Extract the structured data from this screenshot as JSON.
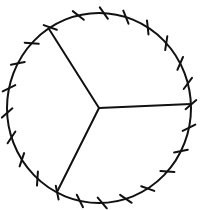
{
  "figure": {
    "type": "circle-divided-into-sectors",
    "width": 207,
    "height": 210,
    "background": "#ffffff",
    "stroke_color": "#111111",
    "circle": {
      "cx": 99,
      "cy": 108,
      "rx": 92,
      "ry": 95,
      "stroke_width": 2
    },
    "center": {
      "x": 99,
      "y": 108
    },
    "radii": [
      {
        "label": "upper-left",
        "x": 49,
        "y": 29
      },
      {
        "label": "right",
        "x": 191,
        "y": 104
      },
      {
        "label": "lower-left",
        "x": 57,
        "y": 192
      }
    ],
    "sector_count": 3,
    "tick_count": 24,
    "tick_length": 14,
    "ticks_deg": [
      -122,
      -103,
      -87,
      -73,
      -58,
      -43,
      -28,
      -15,
      -2,
      12,
      27,
      42,
      58,
      73,
      88,
      102,
      117,
      132,
      147,
      162,
      177,
      192,
      208,
      223
    ]
  }
}
